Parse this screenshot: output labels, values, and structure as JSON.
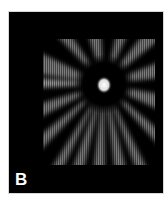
{
  "figure": {
    "panel_label": "B",
    "colors": {
      "background": "#000000",
      "page": "#ffffff",
      "center_spot": "#f0f0f0",
      "rays": "#8a8a8a"
    }
  }
}
